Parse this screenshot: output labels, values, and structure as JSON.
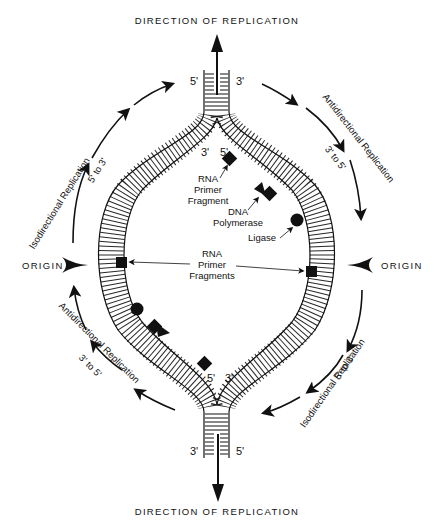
{
  "diagram": {
    "title_top": "DIRECTION OF REPLICATION",
    "title_bottom": "DIRECTION OF REPLICATION",
    "origin_left": "ORIGIN",
    "origin_right": "ORIGIN",
    "top_fork": {
      "left_end": "5'",
      "right_end": "3'",
      "inner_left": "3'",
      "inner_right": "5'"
    },
    "bottom_fork": {
      "left_end": "3'",
      "right_end": "5'",
      "inner_left": "5'",
      "inner_right": "3'"
    },
    "arc_labels": {
      "upper_left": {
        "line1": "Isodirectional Replication",
        "line2": "5' to 3'"
      },
      "upper_right": {
        "line1": "Antidirectional Replication",
        "line2": "3' to 5'"
      },
      "lower_left": {
        "line1": "Antidirectional Replication",
        "line2": "3' to 5'"
      },
      "lower_right": {
        "line1": "Isodirectional Replication",
        "line2": "5' to 3'"
      }
    },
    "annotations": {
      "rna_primer_fragment": [
        "RNA",
        "Primer",
        "Fragment"
      ],
      "dna_polymerase": [
        "DNA",
        "Polymerase"
      ],
      "ligase": "Ligase",
      "rna_primer_fragments": [
        "RNA",
        "Primer",
        "Fragments"
      ]
    },
    "legend_shapes": {
      "square": "RNA primer",
      "triangle": "DNA polymerase",
      "circle": "ligase"
    },
    "colors": {
      "ink": "#111111",
      "background": "#ffffff"
    }
  }
}
